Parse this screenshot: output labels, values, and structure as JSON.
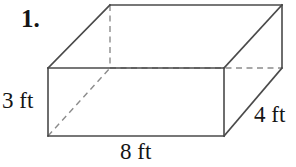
{
  "problem": {
    "number_label": "1.",
    "figure_type": "rectangular-prism"
  },
  "figure": {
    "shape_name": "rectangular prism",
    "unit": "ft",
    "dimensions": {
      "height": "3 ft",
      "width": "8 ft",
      "depth": "4 ft"
    },
    "labels": {
      "height": "3 ft",
      "width": "8 ft",
      "depth": "4 ft"
    },
    "colors": {
      "background": "#ffffff",
      "visible_edge": "#4a4a4a",
      "hidden_edge": "#8c8c8c",
      "text": "#151515"
    },
    "geometry": {
      "front_face": [
        [
          48,
          68
        ],
        [
          224,
          68
        ],
        [
          224,
          136
        ],
        [
          48,
          136
        ]
      ],
      "back_face": [
        [
          110,
          5
        ],
        [
          282,
          5
        ],
        [
          282,
          68
        ],
        [
          110,
          68
        ]
      ],
      "hidden_edges": [
        [
          [
            110,
            5
          ],
          [
            110,
            68
          ]
        ],
        [
          [
            110,
            68
          ],
          [
            282,
            68
          ]
        ],
        [
          [
            48,
            136
          ],
          [
            110,
            68
          ]
        ]
      ]
    }
  }
}
